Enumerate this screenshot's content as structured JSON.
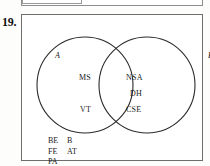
{
  "page": {
    "question_number": "19.",
    "top_fragment_text": "Matching"
  },
  "figure": {
    "type": "venn-diagram-two-set",
    "set_a_label": "A",
    "set_b_label": "B",
    "regions": {
      "a_only": [
        "MS",
        "VT"
      ],
      "intersection": [
        "NSA",
        "DH",
        "CSE"
      ],
      "b_only": [],
      "outside": [
        [
          "BE",
          "B"
        ],
        [
          "FE",
          "AT"
        ],
        [
          "PA",
          ""
        ]
      ]
    }
  },
  "colors": {
    "ink": "#1a1a1a",
    "stroke": "#2b2b2b",
    "box_border": "#6e6e6e",
    "paper": "#fdfdfc"
  }
}
